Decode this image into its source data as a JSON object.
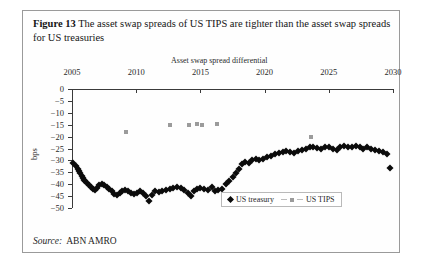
{
  "figure": {
    "number_label": "Figure 13",
    "caption": "The asset swap spreads of US TIPS are tighter than the asset swap spreads for US treasuries",
    "source_label": "Source:",
    "source_value": "ABN AMRO"
  },
  "legend": {
    "position": "inside-bottom-right",
    "items": [
      {
        "label": "US treasury",
        "marker": "diamond",
        "color": "#0b0b0b"
      },
      {
        "label": "US TIPS",
        "marker": "square",
        "color": "#9b9b9b"
      }
    ]
  },
  "chart_data": {
    "type": "scatter",
    "title": "",
    "xlabel": "Asset swap spread differential",
    "ylabel": "bps",
    "xlim": [
      2005,
      2030
    ],
    "ylim": [
      -50,
      0
    ],
    "xticks": [
      2005,
      2010,
      2015,
      2020,
      2025,
      2030
    ],
    "xtick_labels": [
      "2005",
      "2010",
      "2015",
      "2020",
      "2025",
      "2030"
    ],
    "yticks": [
      0,
      -5,
      -10,
      -15,
      -20,
      -25,
      -30,
      -35,
      -40,
      -45,
      -50
    ],
    "ytick_labels": [
      "0",
      "−5",
      "−10",
      "−15",
      "−20",
      "−25",
      "−30",
      "−35",
      "−40",
      "−45",
      "−50"
    ],
    "grid": false,
    "x_axis_position": "top",
    "series": [
      {
        "name": "US treasury",
        "marker": "diamond",
        "color": "#0b0b0b",
        "points": [
          [
            2005.1,
            -31.0
          ],
          [
            2005.3,
            -32.5
          ],
          [
            2005.45,
            -33.5
          ],
          [
            2005.55,
            -34.5
          ],
          [
            2005.65,
            -35.5
          ],
          [
            2005.75,
            -36.5
          ],
          [
            2005.85,
            -37.5
          ],
          [
            2005.95,
            -38.2
          ],
          [
            2006.05,
            -38.8
          ],
          [
            2006.2,
            -39.5
          ],
          [
            2006.35,
            -40.2
          ],
          [
            2006.5,
            -41.0
          ],
          [
            2006.65,
            -42.0
          ],
          [
            2006.8,
            -42.5
          ],
          [
            2006.95,
            -41.5
          ],
          [
            2007.1,
            -40.5
          ],
          [
            2007.3,
            -40.0
          ],
          [
            2007.5,
            -40.2
          ],
          [
            2007.7,
            -41.0
          ],
          [
            2007.9,
            -42.0
          ],
          [
            2008.1,
            -43.0
          ],
          [
            2008.3,
            -44.0
          ],
          [
            2008.5,
            -44.5
          ],
          [
            2008.7,
            -43.8
          ],
          [
            2008.9,
            -43.0
          ],
          [
            2009.1,
            -42.5
          ],
          [
            2009.35,
            -43.0
          ],
          [
            2009.6,
            -43.5
          ],
          [
            2009.85,
            -44.0
          ],
          [
            2010.05,
            -43.5
          ],
          [
            2010.3,
            -42.8
          ],
          [
            2010.55,
            -43.5
          ],
          [
            2010.8,
            -45.0
          ],
          [
            2011.0,
            -47.0
          ],
          [
            2011.25,
            -44.5
          ],
          [
            2011.5,
            -43.0
          ],
          [
            2011.75,
            -43.2
          ],
          [
            2012.0,
            -43.0
          ],
          [
            2012.3,
            -42.5
          ],
          [
            2012.6,
            -42.0
          ],
          [
            2012.9,
            -41.5
          ],
          [
            2013.2,
            -41.0
          ],
          [
            2013.5,
            -41.5
          ],
          [
            2013.75,
            -42.5
          ],
          [
            2014.0,
            -43.5
          ],
          [
            2014.25,
            -45.0
          ],
          [
            2014.5,
            -43.0
          ],
          [
            2014.75,
            -42.0
          ],
          [
            2015.0,
            -41.5
          ],
          [
            2015.3,
            -42.0
          ],
          [
            2015.6,
            -42.5
          ],
          [
            2015.9,
            -41.0
          ],
          [
            2016.15,
            -43.0
          ],
          [
            2016.4,
            -42.5
          ],
          [
            2016.7,
            -42.0
          ],
          [
            2017.0,
            -40.0
          ],
          [
            2017.25,
            -38.5
          ],
          [
            2017.5,
            -37.0
          ],
          [
            2017.75,
            -35.5
          ],
          [
            2018.0,
            -33.5
          ],
          [
            2018.25,
            -31.5
          ],
          [
            2018.5,
            -30.5
          ],
          [
            2018.75,
            -31.0
          ],
          [
            2019.0,
            -30.0
          ],
          [
            2019.3,
            -29.5
          ],
          [
            2019.6,
            -30.0
          ],
          [
            2019.9,
            -29.5
          ],
          [
            2020.2,
            -28.5
          ],
          [
            2020.5,
            -28.0
          ],
          [
            2020.8,
            -27.5
          ],
          [
            2021.1,
            -27.0
          ],
          [
            2021.4,
            -26.5
          ],
          [
            2021.7,
            -26.0
          ],
          [
            2022.0,
            -26.5
          ],
          [
            2022.3,
            -27.0
          ],
          [
            2022.6,
            -26.0
          ],
          [
            2022.9,
            -25.5
          ],
          [
            2023.2,
            -25.0
          ],
          [
            2023.5,
            -24.5
          ],
          [
            2023.8,
            -24.5
          ],
          [
            2024.1,
            -24.8
          ],
          [
            2024.4,
            -25.0
          ],
          [
            2024.7,
            -24.5
          ],
          [
            2025.0,
            -24.5
          ],
          [
            2025.3,
            -25.0
          ],
          [
            2025.6,
            -25.5
          ],
          [
            2025.9,
            -24.5
          ],
          [
            2026.2,
            -24.0
          ],
          [
            2026.5,
            -24.5
          ],
          [
            2026.8,
            -24.2
          ],
          [
            2027.1,
            -24.0
          ],
          [
            2027.4,
            -24.5
          ],
          [
            2027.7,
            -25.0
          ],
          [
            2028.0,
            -24.5
          ],
          [
            2028.3,
            -25.0
          ],
          [
            2028.6,
            -25.5
          ],
          [
            2028.9,
            -26.0
          ],
          [
            2029.2,
            -26.5
          ],
          [
            2029.5,
            -27.5
          ],
          [
            2029.8,
            -33.0
          ]
        ]
      },
      {
        "name": "US TIPS",
        "marker": "square",
        "color": "#9b9b9b",
        "points": [
          [
            2009.2,
            -18.0
          ],
          [
            2012.6,
            -15.0
          ],
          [
            2014.1,
            -15.0
          ],
          [
            2014.7,
            -14.6
          ],
          [
            2015.1,
            -15.3
          ],
          [
            2016.3,
            -14.8
          ],
          [
            2023.6,
            -20.0
          ]
        ]
      }
    ]
  }
}
